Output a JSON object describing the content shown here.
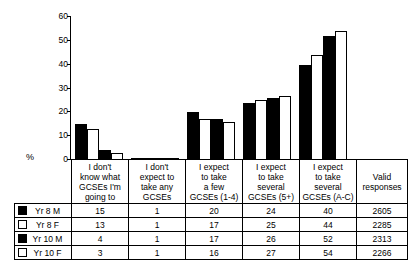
{
  "chart_data": {
    "type": "bar",
    "title": "",
    "xlabel": "",
    "ylabel": "%",
    "ylim": [
      0,
      60
    ],
    "yticks": [
      0,
      10,
      20,
      30,
      40,
      50,
      60
    ],
    "grid": false,
    "legend_position": "table-left",
    "categories": [
      "I don't know what GCSEs I'm going to",
      "I don't expect to take any GCSEs",
      "I expect to take a few GCSEs (1-4)",
      "I expect to take several GCSEs (5+)",
      "I expect to take several GCSEs (A-C)"
    ],
    "series": [
      {
        "name": "Yr 8 M",
        "fill": "black",
        "values": [
          15,
          1,
          20,
          24,
          40
        ],
        "valid_responses": 2605
      },
      {
        "name": "Yr 8 F",
        "fill": "white",
        "values": [
          13,
          1,
          17,
          25,
          44
        ],
        "valid_responses": 2285
      },
      {
        "name": "Yr 10 M",
        "fill": "black",
        "values": [
          4,
          1,
          17,
          26,
          52
        ],
        "valid_responses": 2313
      },
      {
        "name": "Yr 10 F",
        "fill": "white",
        "values": [
          3,
          1,
          16,
          27,
          54
        ],
        "valid_responses": 2266
      }
    ]
  },
  "axis": {
    "y_label": "%",
    "tick_labels": [
      "60",
      "50",
      "40",
      "30",
      "20",
      "10",
      "0"
    ]
  },
  "table": {
    "column_headers": [
      [
        "I don't",
        "know what",
        "GCSEs I'm",
        "going to"
      ],
      [
        "I don't",
        "expect to",
        "take any",
        "GCSEs"
      ],
      [
        "I expect",
        "to take",
        "a few",
        "GCSEs (1-4)"
      ],
      [
        "I expect",
        "to take",
        "several",
        "GCSEs (5+)"
      ],
      [
        "I expect",
        "to take",
        "several",
        "GCSEs (A-C)"
      ],
      [
        "Valid",
        "responses"
      ]
    ],
    "rows": [
      {
        "label": "Yr 8 M",
        "swatch": "black",
        "cells": [
          "15",
          "1",
          "20",
          "24",
          "40",
          "2605"
        ]
      },
      {
        "label": "Yr 8 F",
        "swatch": "white",
        "cells": [
          "13",
          "1",
          "17",
          "25",
          "44",
          "2285"
        ]
      },
      {
        "label": "Yr 10 M",
        "swatch": "black",
        "cells": [
          "4",
          "1",
          "17",
          "26",
          "52",
          "2313"
        ]
      },
      {
        "label": "Yr 10 F",
        "swatch": "white",
        "cells": [
          "3",
          "1",
          "16",
          "27",
          "54",
          "2266"
        ]
      }
    ]
  },
  "colors": {
    "bar_black": "#000000",
    "bar_white": "#ffffff",
    "line": "#000000"
  }
}
